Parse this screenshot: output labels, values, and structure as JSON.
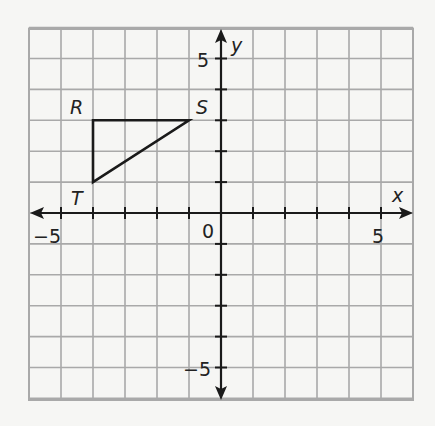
{
  "chart_data": {
    "type": "scatter",
    "title": "",
    "xlabel": "x",
    "ylabel": "y",
    "xlim": [
      -6,
      6
    ],
    "ylim": [
      -6,
      6
    ],
    "grid": true,
    "tick_labels": {
      "x": [
        "-5",
        "0",
        "5"
      ],
      "y": [
        "5",
        "-5"
      ]
    },
    "origin_label": "0",
    "polygon": {
      "name": "triangle RST",
      "vertices": [
        {
          "label": "R",
          "x": -4,
          "y": 3
        },
        {
          "label": "S",
          "x": -1,
          "y": 3
        },
        {
          "label": "T",
          "x": -4,
          "y": 1
        }
      ]
    }
  },
  "labels": {
    "x_axis": "x",
    "y_axis": "y",
    "origin": "0",
    "x_neg5": "−5",
    "x_pos5": "5",
    "y_pos5": "5",
    "y_neg5": "−5",
    "R": "R",
    "S": "S",
    "T": "T"
  },
  "colors": {
    "grid": "#a9a9a9",
    "axis": "#1a1a1a",
    "triangle": "#1a1a1a",
    "background": "#f6f6f4"
  }
}
